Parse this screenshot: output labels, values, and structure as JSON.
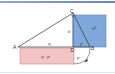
{
  "diagram": {
    "points": {
      "A": "A",
      "B": "B",
      "C": "C",
      "D": "D"
    },
    "labels": {
      "q": "q",
      "h": "h",
      "h_squared": "h²",
      "p_on_square": "p",
      "product": "q · p",
      "p_arc": "p"
    },
    "colors": {
      "square_fill": "#7fa8dc",
      "rect_fill": "#f2c4c4",
      "rect_stroke": "#c98a8a",
      "line": "#333333",
      "top_bar": "#7a8fc6",
      "bottom_bar": "#dfe9f5"
    }
  }
}
